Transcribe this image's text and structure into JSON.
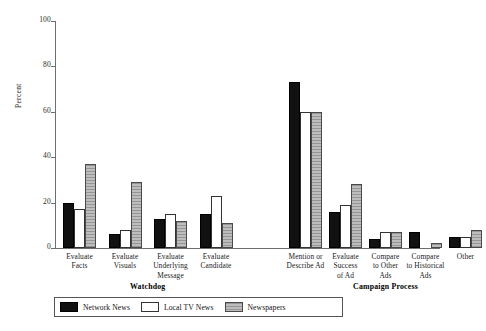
{
  "chart_data": {
    "type": "bar",
    "title": "",
    "xlabel": "",
    "ylabel": "Percent",
    "ylim": [
      0,
      100
    ],
    "yticks": [
      0,
      20,
      40,
      60,
      80,
      100
    ],
    "grid": false,
    "legend_position": "bottom-left",
    "categories": [
      "Evaluate\nFacts",
      "Evaluate\nVisuals",
      "Evaluate\nUnderlying\nMessage",
      "Evaluate\nCandidate",
      "Mention or\nDescribe Ad",
      "Evaluate\nSuccess\nof Ad",
      "Compare\nto Other\nAds",
      "Compare\nto Historical\nAds",
      "Other"
    ],
    "series": [
      {
        "name": "Network News",
        "color": "#111111",
        "values": [
          20,
          6,
          13,
          15,
          73,
          16,
          4,
          7,
          5
        ]
      },
      {
        "name": "Local TV News",
        "color": "#ffffff",
        "values": [
          17,
          8,
          15,
          23,
          60,
          19,
          7,
          0,
          5
        ]
      },
      {
        "name": "Newspapers",
        "color": "#a9a9a9",
        "values": [
          37,
          29,
          12,
          11,
          60,
          28,
          7,
          2,
          8
        ]
      }
    ],
    "group_titles": [
      {
        "label": "Watchdog",
        "start_category": 0,
        "end_category": 3
      },
      {
        "label": "Campaign Process",
        "start_category": 4,
        "end_category": 8
      }
    ]
  },
  "legend": {
    "items": [
      {
        "label": "Network News"
      },
      {
        "label": "Local TV News"
      },
      {
        "label": "Newspapers"
      }
    ]
  }
}
